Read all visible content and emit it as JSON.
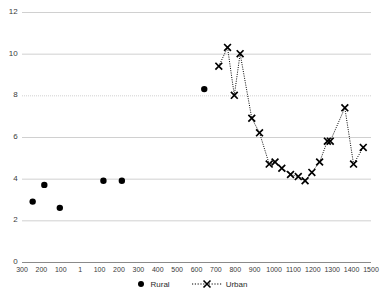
{
  "chart_data": {
    "type": "scatter",
    "title": "",
    "xlabel": "",
    "ylabel": "",
    "ylim": [
      0,
      12
    ],
    "yticks": [
      0,
      2,
      4,
      6,
      8,
      10,
      12
    ],
    "grid": true,
    "legend_position": "bottom-center",
    "xticks": [
      "300",
      "200",
      "100",
      "1",
      "100",
      "200",
      "300",
      "400",
      "500",
      "600",
      "700",
      "800",
      "900",
      "1000",
      "1100",
      "1200",
      "1300",
      "1400",
      "1500"
    ],
    "x_index_positions": [
      0,
      1,
      2,
      3,
      4,
      5,
      6,
      7,
      8,
      9,
      10,
      11,
      12,
      13,
      14,
      15,
      16,
      17,
      18
    ],
    "series": [
      {
        "name": "Rural",
        "marker": "filled-circle",
        "line": "none",
        "color": "#000000",
        "points": [
          {
            "x": 0.55,
            "y": 2.9
          },
          {
            "x": 1.15,
            "y": 3.7
          },
          {
            "x": 1.95,
            "y": 2.6
          },
          {
            "x": 4.2,
            "y": 3.9
          },
          {
            "x": 5.15,
            "y": 3.9
          },
          {
            "x": 9.4,
            "y": 8.3
          }
        ]
      },
      {
        "name": "Urban",
        "marker": "x-cross",
        "line": "dotted",
        "color": "#000000",
        "points": [
          {
            "x": 10.15,
            "y": 9.4
          },
          {
            "x": 10.6,
            "y": 10.3
          },
          {
            "x": 10.95,
            "y": 8.0
          },
          {
            "x": 11.25,
            "y": 10.0
          },
          {
            "x": 11.85,
            "y": 6.9
          },
          {
            "x": 12.25,
            "y": 6.2
          },
          {
            "x": 12.75,
            "y": 4.7
          },
          {
            "x": 13.05,
            "y": 4.8
          },
          {
            "x": 13.4,
            "y": 4.5
          },
          {
            "x": 13.85,
            "y": 4.2
          },
          {
            "x": 14.25,
            "y": 4.1
          },
          {
            "x": 14.6,
            "y": 3.9
          },
          {
            "x": 14.95,
            "y": 4.3
          },
          {
            "x": 15.35,
            "y": 4.8
          },
          {
            "x": 15.75,
            "y": 5.8
          },
          {
            "x": 15.9,
            "y": 5.8
          },
          {
            "x": 16.65,
            "y": 7.4
          },
          {
            "x": 17.1,
            "y": 4.7
          },
          {
            "x": 17.6,
            "y": 5.5
          }
        ]
      }
    ]
  },
  "legend": {
    "rural_label": "Rural",
    "urban_label": "Urban"
  },
  "axis": {
    "y_tick_labels": [
      "12",
      "10",
      "8",
      "6",
      "4",
      "2",
      "0"
    ],
    "x_tick_labels": [
      "300",
      "200",
      "100",
      "1",
      "100",
      "200",
      "300",
      "400",
      "500",
      "600",
      "700",
      "800",
      "900",
      "1000",
      "1100",
      "1200",
      "1300",
      "1400",
      "1500"
    ]
  },
  "colors": {
    "marker": "#000000",
    "grid": "#d0d0d0",
    "axis": "#808080",
    "text": "#3a3a3a"
  }
}
